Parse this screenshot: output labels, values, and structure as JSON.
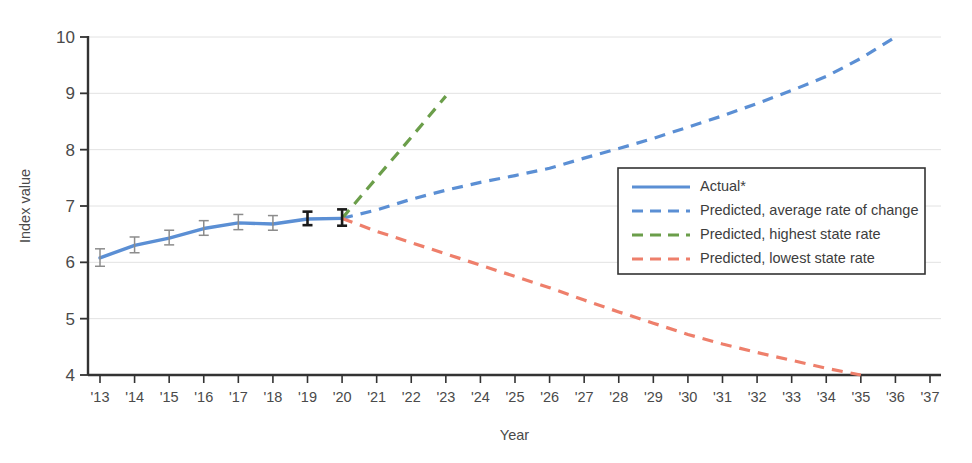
{
  "chart_data": {
    "type": "line",
    "title": "",
    "xlabel": "Year",
    "ylabel": "Index value",
    "xlim": [
      2013,
      2037
    ],
    "ylim": [
      4,
      10
    ],
    "grid": true,
    "legend_position": "right",
    "x": [
      2013,
      2014,
      2015,
      2016,
      2017,
      2018,
      2019,
      2020,
      2021,
      2022,
      2023,
      2024,
      2025,
      2026,
      2027,
      2028,
      2029,
      2030,
      2031,
      2032,
      2033,
      2034,
      2035,
      2036,
      2037
    ],
    "xtick_labels": [
      "'13",
      "'14",
      "'15",
      "'16",
      "'17",
      "'18",
      "'19",
      "'20",
      "'21",
      "'22",
      "'23",
      "'24",
      "'25",
      "'26",
      "'27",
      "'28",
      "'29",
      "'30",
      "'31",
      "'32",
      "'33",
      "'34",
      "'35",
      "'36",
      "'37"
    ],
    "ytick_labels": [
      "10",
      "9",
      "8",
      "7",
      "6",
      "5",
      "4"
    ],
    "ytick_values": [
      10,
      9,
      8,
      7,
      6,
      5,
      4
    ],
    "series": [
      {
        "name": "Actual*",
        "style": "solid",
        "color": "#5B8FD4",
        "x": [
          2013,
          2014,
          2015,
          2016,
          2017,
          2018,
          2019,
          2020
        ],
        "values": [
          6.08,
          6.3,
          6.43,
          6.6,
          6.7,
          6.68,
          6.77,
          6.78
        ],
        "error_bars": [
          {
            "x": 2013,
            "value": 6.08,
            "low": 5.93,
            "high": 6.24,
            "color": "#8c8c8c"
          },
          {
            "x": 2014,
            "value": 6.3,
            "low": 6.17,
            "high": 6.45,
            "color": "#8c8c8c"
          },
          {
            "x": 2015,
            "value": 6.43,
            "low": 6.31,
            "high": 6.57,
            "color": "#8c8c8c"
          },
          {
            "x": 2016,
            "value": 6.6,
            "low": 6.48,
            "high": 6.74,
            "color": "#8c8c8c"
          },
          {
            "x": 2017,
            "value": 6.7,
            "low": 6.58,
            "high": 6.85,
            "color": "#8c8c8c"
          },
          {
            "x": 2018,
            "value": 6.68,
            "low": 6.57,
            "high": 6.83,
            "color": "#8c8c8c"
          },
          {
            "x": 2019,
            "value": 6.77,
            "low": 6.66,
            "high": 6.9,
            "color": "#1a1a1a"
          },
          {
            "x": 2020,
            "value": 6.78,
            "low": 6.65,
            "high": 6.94,
            "color": "#1a1a1a"
          }
        ]
      },
      {
        "name": "Predicted, average rate of change",
        "style": "dashed",
        "color": "#5B8FD4",
        "x": [
          2020,
          2021,
          2022,
          2023,
          2024,
          2025,
          2026,
          2027,
          2028,
          2029,
          2030,
          2031,
          2032,
          2033,
          2034,
          2035,
          2036
        ],
        "values": [
          6.78,
          6.93,
          7.12,
          7.28,
          7.42,
          7.54,
          7.67,
          7.85,
          8.02,
          8.2,
          8.4,
          8.6,
          8.82,
          9.05,
          9.3,
          9.62,
          10.0
        ]
      },
      {
        "name": "Predicted, highest state rate",
        "style": "dashed",
        "color": "#6B9E4A",
        "x": [
          2020,
          2021,
          2022,
          2023
        ],
        "values": [
          6.78,
          7.5,
          8.22,
          8.95
        ]
      },
      {
        "name": "Predicted, lowest state rate",
        "style": "dashed",
        "color": "#EE7F6B",
        "x": [
          2020,
          2021,
          2022,
          2023,
          2024,
          2025,
          2026,
          2027,
          2028,
          2029,
          2030,
          2031,
          2032,
          2033,
          2034,
          2035
        ],
        "values": [
          6.78,
          6.55,
          6.35,
          6.15,
          5.95,
          5.75,
          5.55,
          5.33,
          5.12,
          4.92,
          4.72,
          4.55,
          4.4,
          4.26,
          4.12,
          4.0
        ]
      }
    ],
    "legend": [
      {
        "label": "Actual*",
        "color": "#5B8FD4",
        "style": "solid"
      },
      {
        "label": "Predicted, average rate of change",
        "color": "#5B8FD4",
        "style": "dashed"
      },
      {
        "label": "Predicted, highest state rate",
        "color": "#6B9E4A",
        "style": "dashed"
      },
      {
        "label": "Predicted, lowest state rate",
        "color": "#EE7F6B",
        "style": "dashed"
      }
    ]
  },
  "axes": {
    "ylabel": "Index value",
    "xlabel": "Year"
  }
}
